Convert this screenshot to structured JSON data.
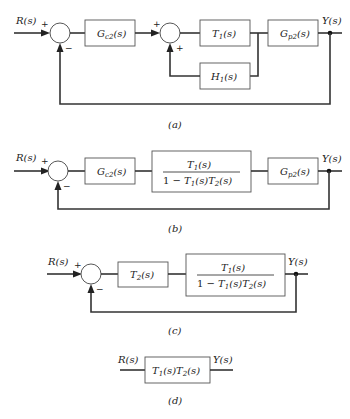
{
  "figure": {
    "panels": [
      {
        "id": "a",
        "caption": "(a)",
        "input_label": "R(s)",
        "output_label": "Y(s)",
        "sum1_signs": [
          "+",
          "−"
        ],
        "sum2_signs": [
          "+",
          "+"
        ],
        "blocks": [
          "G_c2(s)",
          "T_1(s)",
          "H_1(s)",
          "G_p2(s)"
        ]
      },
      {
        "id": "b",
        "caption": "(b)",
        "input_label": "R(s)",
        "output_label": "Y(s)",
        "sum_signs": [
          "+",
          "−"
        ],
        "blocks": [
          "G_c2(s)",
          "T_1(s) / (1 − T_1(s)T_2(s))",
          "G_p2(s)"
        ]
      },
      {
        "id": "c",
        "caption": "(c)",
        "input_label": "R(s)",
        "output_label": "Y(s)",
        "sum_signs": [
          "+",
          "−"
        ],
        "blocks": [
          "T_2(s)",
          "T_1(s) / (1 − T_1(s)T_2(s))"
        ]
      },
      {
        "id": "d",
        "caption": "(d)",
        "input_label": "R(s)",
        "output_label": "Y(s)",
        "blocks": [
          "T_1(s)T_2(s)"
        ]
      }
    ]
  },
  "text": {
    "R": "R(s)",
    "Y": "Y(s)",
    "plus": "+",
    "minus": "−",
    "Gc_main": "G",
    "Gc_sub": "c2",
    "Gp_main": "G",
    "Gp_sub": "p2",
    "T1_main": "T",
    "T1_sub": "1",
    "H1_main": "H",
    "H1_sub": "1",
    "T2_main": "T",
    "T2_sub": "2",
    "arg": "(s)",
    "one_minus": "1 − ",
    "cap_a": "(a)",
    "cap_b": "(b)",
    "cap_c": "(c)",
    "cap_d": "(d)"
  }
}
